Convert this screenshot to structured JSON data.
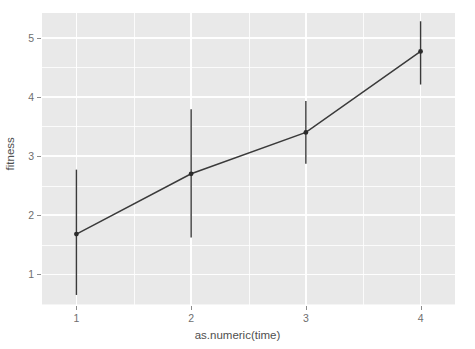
{
  "chart_data": {
    "type": "line",
    "title": "",
    "subtitle": "",
    "xlabel": "as.numeric(time)",
    "ylabel": "fitness",
    "x": [
      1,
      2,
      3,
      4
    ],
    "xtick_labels": [
      "1",
      "2",
      "3",
      "4"
    ],
    "ytick_labels": [
      "1",
      "2",
      "3",
      "4",
      "5"
    ],
    "ytick_values": [
      1,
      2,
      3,
      4,
      5
    ],
    "xlim": [
      0.7,
      4.3
    ],
    "ylim": [
      0.48,
      5.42
    ],
    "grid": true,
    "legend": "none",
    "series": [
      {
        "name": "fitness",
        "values": [
          1.68,
          2.7,
          3.4,
          4.77
        ],
        "error_low": [
          0.65,
          1.62,
          2.87,
          4.21
        ],
        "error_high": [
          2.77,
          3.79,
          3.93,
          5.28
        ],
        "line_color": "#3a3a3a",
        "point_color": "#2b2b2b",
        "errorbar_color": "#3a3a3a"
      }
    ],
    "panel_background": "#e9e9e9",
    "grid_color": "#ffffff",
    "axis_text_color": "#6e6e6e",
    "axis_title_color": "#4f4f4f"
  },
  "axis": {
    "x_title": "as.numeric(time)",
    "y_title": "fitness",
    "x_ticks": [
      "1",
      "2",
      "3",
      "4"
    ],
    "y_ticks": [
      "1",
      "2",
      "3",
      "4",
      "5"
    ]
  }
}
